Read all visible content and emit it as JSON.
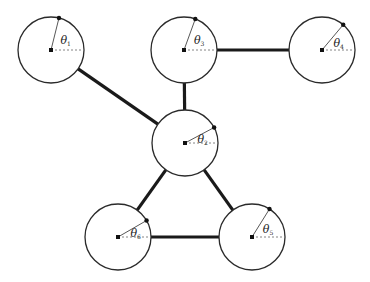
{
  "diagram": {
    "type": "graph",
    "node_radius": 33,
    "colors": {
      "stroke": "#2a2a2a",
      "edge": "#1a1a1a",
      "dashed": "#777777",
      "background": "#ffffff"
    },
    "nodes": [
      {
        "id": "n1",
        "label": "θ",
        "sub": "1",
        "cx": 51,
        "cy": 50,
        "angle_deg": 76
      },
      {
        "id": "n3",
        "label": "θ",
        "sub": "3",
        "cx": 184,
        "cy": 50,
        "angle_deg": 70
      },
      {
        "id": "n4",
        "label": "θ",
        "sub": "4",
        "cx": 322,
        "cy": 50,
        "angle_deg": 50
      },
      {
        "id": "n2",
        "label": "θ",
        "sub": "2",
        "cx": 185,
        "cy": 143,
        "angle_deg": 28
      },
      {
        "id": "n6",
        "label": "θ",
        "sub": "6",
        "cx": 118,
        "cy": 237,
        "angle_deg": 30
      },
      {
        "id": "n5",
        "label": "θ",
        "sub": "5",
        "cx": 252,
        "cy": 237,
        "angle_deg": 58
      }
    ],
    "edges": [
      {
        "from": "n1",
        "to": "n2"
      },
      {
        "from": "n3",
        "to": "n4"
      },
      {
        "from": "n3",
        "to": "n2"
      },
      {
        "from": "n2",
        "to": "n6"
      },
      {
        "from": "n2",
        "to": "n5"
      },
      {
        "from": "n6",
        "to": "n5"
      }
    ]
  }
}
